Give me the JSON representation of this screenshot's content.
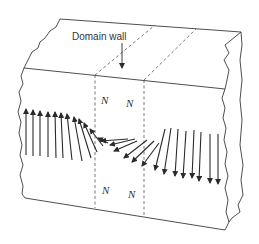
{
  "diagram": {
    "annotation_label": "Domain wall",
    "domain_labels": [
      {
        "text": "N",
        "x": 101,
        "y": 104
      },
      {
        "text": "N",
        "x": 126,
        "y": 107
      },
      {
        "text": "N",
        "x": 102,
        "y": 194
      },
      {
        "text": "N",
        "x": 128,
        "y": 198
      }
    ],
    "colors": {
      "line": "#3a3a3a",
      "dashed": "#555555",
      "text": "#333333",
      "background": "#ffffff"
    },
    "magnetization_arrows": [
      {
        "x1": 26,
        "y1": 155,
        "x2": 26,
        "y2": 109
      },
      {
        "x1": 33,
        "y1": 156,
        "x2": 33,
        "y2": 110
      },
      {
        "x1": 40,
        "y1": 156,
        "x2": 40,
        "y2": 111
      },
      {
        "x1": 48,
        "y1": 157,
        "x2": 48,
        "y2": 112
      },
      {
        "x1": 56,
        "y1": 158,
        "x2": 55,
        "y2": 112
      },
      {
        "x1": 63,
        "y1": 158,
        "x2": 61,
        "y2": 113
      },
      {
        "x1": 72,
        "y1": 160,
        "x2": 67,
        "y2": 114
      },
      {
        "x1": 82,
        "y1": 161,
        "x2": 74,
        "y2": 117
      },
      {
        "x1": 91,
        "y1": 158,
        "x2": 79,
        "y2": 119
      },
      {
        "x1": 97,
        "y1": 152,
        "x2": 84,
        "y2": 123
      },
      {
        "x1": 103,
        "y1": 146,
        "x2": 90,
        "y2": 129
      },
      {
        "x1": 108,
        "y1": 143,
        "x2": 98,
        "y2": 138
      },
      {
        "x1": 128,
        "y1": 139,
        "x2": 101,
        "y2": 141
      },
      {
        "x1": 135,
        "y1": 139,
        "x2": 110,
        "y2": 145
      },
      {
        "x1": 137,
        "y1": 141,
        "x2": 114,
        "y2": 151
      },
      {
        "x1": 147,
        "y1": 140,
        "x2": 124,
        "y2": 158
      },
      {
        "x1": 154,
        "y1": 141,
        "x2": 132,
        "y2": 162
      },
      {
        "x1": 159,
        "y1": 143,
        "x2": 142,
        "y2": 166
      },
      {
        "x1": 165,
        "y1": 129,
        "x2": 155,
        "y2": 170
      },
      {
        "x1": 171,
        "y1": 128,
        "x2": 164,
        "y2": 174
      },
      {
        "x1": 178,
        "y1": 129,
        "x2": 175,
        "y2": 176
      },
      {
        "x1": 186,
        "y1": 131,
        "x2": 183,
        "y2": 178
      },
      {
        "x1": 194,
        "y1": 130,
        "x2": 192,
        "y2": 178
      },
      {
        "x1": 201,
        "y1": 132,
        "x2": 199,
        "y2": 181
      },
      {
        "x1": 210,
        "y1": 134,
        "x2": 210,
        "y2": 183
      },
      {
        "x1": 218,
        "y1": 134,
        "x2": 218,
        "y2": 184
      }
    ]
  }
}
